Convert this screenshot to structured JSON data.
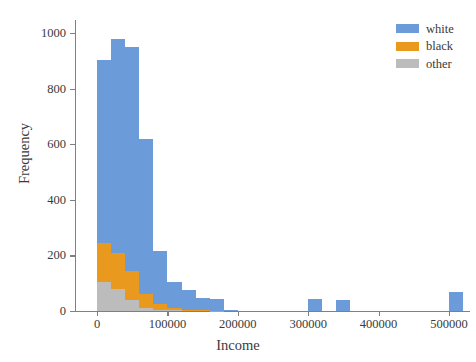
{
  "chart_data": {
    "type": "bar",
    "subtype": "stacked-histogram",
    "title": "",
    "xlabel": "Income",
    "ylabel": "Frequency",
    "xlim": [
      -30000,
      530000
    ],
    "ylim": [
      0,
      1040
    ],
    "grid": false,
    "legend_position": "top-right",
    "xticks": [
      0,
      100000,
      200000,
      300000,
      400000,
      500000
    ],
    "xtick_labels": [
      "0",
      "100000",
      "200000",
      "300000",
      "400000",
      "500000"
    ],
    "yticks": [
      0,
      200,
      400,
      600,
      800,
      1000
    ],
    "ytick_labels": [
      "0",
      "200",
      "400",
      "600",
      "800",
      "1000"
    ],
    "bin_width": 20000,
    "bin_starts": [
      0,
      20000,
      40000,
      60000,
      80000,
      100000,
      120000,
      140000,
      160000,
      180000,
      200000,
      220000,
      240000,
      260000,
      280000,
      300000,
      320000,
      340000,
      360000,
      380000,
      400000,
      420000,
      440000,
      460000,
      480000,
      500000
    ],
    "series": [
      {
        "name": "white",
        "color": "#6b9bd9",
        "values": [
          660,
          770,
          805,
          560,
          190,
          95,
          70,
          46,
          43,
          5,
          0,
          0,
          0,
          0,
          0,
          45,
          0,
          40,
          0,
          0,
          0,
          0,
          0,
          0,
          0,
          70
        ]
      },
      {
        "name": "black",
        "color": "#e8991e",
        "values": [
          140,
          130,
          105,
          48,
          20,
          8,
          5,
          2,
          1,
          0,
          0,
          0,
          0,
          0,
          0,
          0,
          0,
          0,
          0,
          0,
          0,
          0,
          0,
          0,
          0,
          0
        ]
      },
      {
        "name": "other",
        "color": "#bcbcbc",
        "values": [
          105,
          80,
          40,
          12,
          5,
          2,
          0,
          0,
          0,
          0,
          0,
          0,
          0,
          0,
          0,
          0,
          0,
          0,
          0,
          0,
          0,
          0,
          0,
          0,
          0,
          0
        ]
      }
    ],
    "stack_totals": [
      905,
      980,
      950,
      620,
      215,
      105,
      75,
      48,
      44,
      5,
      0,
      0,
      0,
      0,
      0,
      45,
      0,
      40,
      0,
      0,
      0,
      0,
      0,
      0,
      0,
      70
    ]
  },
  "legend": {
    "items": [
      {
        "label": "white",
        "color": "#6b9bd9"
      },
      {
        "label": "black",
        "color": "#e8991e"
      },
      {
        "label": "other",
        "color": "#bcbcbc"
      }
    ]
  },
  "axes": {
    "x_title": "Income",
    "y_title": "Frequency"
  },
  "colors": {
    "axis": "#808080",
    "text": "#3a3a3a",
    "background": "#ffffff"
  }
}
